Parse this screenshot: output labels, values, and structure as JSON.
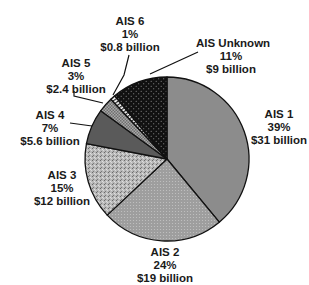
{
  "chart_data": {
    "type": "pie",
    "title": "",
    "start_angle": "top, clockwise",
    "slices": [
      {
        "label": "AIS 1",
        "percent": 39,
        "value": 31,
        "value_text": "$31 billion",
        "percent_text": "39%",
        "color": "#8c8c8c",
        "pattern": "solid"
      },
      {
        "label": "AIS 2",
        "percent": 24,
        "value": 19,
        "value_text": "$19 billion",
        "percent_text": "24%",
        "color": "#9e9e9e",
        "pattern": "fine-dots"
      },
      {
        "label": "AIS 3",
        "percent": 15,
        "value": 12,
        "value_text": "$12 billion",
        "percent_text": "15%",
        "color": "#b4b4b4",
        "pattern": "speckled"
      },
      {
        "label": "AIS 4",
        "percent": 7,
        "value": 5.6,
        "value_text": "$5.6 billion",
        "percent_text": "7%",
        "color": "#5a5a5a",
        "pattern": "solid-dark"
      },
      {
        "label": "AIS 5",
        "percent": 3,
        "value": 2.4,
        "value_text": "$2.4 billion",
        "percent_text": "3%",
        "color": "#a0a0a0",
        "pattern": "checker"
      },
      {
        "label": "AIS 6",
        "percent": 1,
        "value": 0.8,
        "value_text": "$0.8 billion",
        "percent_text": "1%",
        "color": "#ffffff",
        "pattern": "stripes"
      },
      {
        "label": "AIS Unknown",
        "percent": 11,
        "value": 9,
        "value_text": "$9 billion",
        "percent_text": "11%",
        "color": "#111111",
        "pattern": "white-dots"
      }
    ],
    "units": "billion USD",
    "legend": "none (direct labels)"
  }
}
